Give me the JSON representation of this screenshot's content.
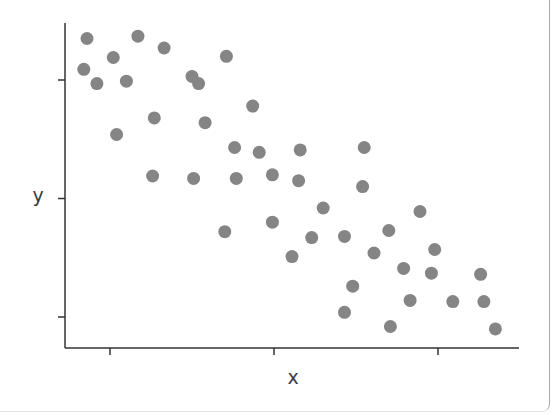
{
  "chart_data": {
    "type": "scatter",
    "title": "",
    "xlabel": "x",
    "ylabel": "y",
    "xticks": [
      1,
      2,
      3
    ],
    "yticks": [
      1,
      2,
      3
    ],
    "xtick_labels": [
      "",
      "",
      ""
    ],
    "ytick_labels": [
      "",
      "",
      ""
    ],
    "xlim": [
      0.66,
      3.49
    ],
    "ylim": [
      0.77,
      3.48
    ],
    "grid": false,
    "legend": null,
    "marker_color": "#858585",
    "marker_radius_px": 6.5,
    "points": [
      {
        "x": 0.86,
        "y": 3.35
      },
      {
        "x": 1.17,
        "y": 3.37
      },
      {
        "x": 1.33,
        "y": 3.27
      },
      {
        "x": 1.02,
        "y": 3.19
      },
      {
        "x": 0.84,
        "y": 3.09
      },
      {
        "x": 0.92,
        "y": 2.97
      },
      {
        "x": 1.1,
        "y": 2.99
      },
      {
        "x": 1.71,
        "y": 3.2
      },
      {
        "x": 1.5,
        "y": 3.03
      },
      {
        "x": 1.54,
        "y": 2.97
      },
      {
        "x": 1.87,
        "y": 2.78
      },
      {
        "x": 1.27,
        "y": 2.68
      },
      {
        "x": 1.58,
        "y": 2.64
      },
      {
        "x": 1.04,
        "y": 2.54
      },
      {
        "x": 1.76,
        "y": 2.43
      },
      {
        "x": 1.26,
        "y": 2.19
      },
      {
        "x": 1.51,
        "y": 2.17
      },
      {
        "x": 1.77,
        "y": 2.17
      },
      {
        "x": 1.91,
        "y": 2.39
      },
      {
        "x": 2.16,
        "y": 2.41
      },
      {
        "x": 2.55,
        "y": 2.43
      },
      {
        "x": 1.99,
        "y": 2.2
      },
      {
        "x": 2.15,
        "y": 2.15
      },
      {
        "x": 2.54,
        "y": 2.1
      },
      {
        "x": 2.3,
        "y": 1.92
      },
      {
        "x": 1.99,
        "y": 1.8
      },
      {
        "x": 1.7,
        "y": 1.72
      },
      {
        "x": 2.23,
        "y": 1.67
      },
      {
        "x": 2.11,
        "y": 1.51
      },
      {
        "x": 2.43,
        "y": 1.68
      },
      {
        "x": 2.89,
        "y": 1.89
      },
      {
        "x": 2.7,
        "y": 1.73
      },
      {
        "x": 2.61,
        "y": 1.54
      },
      {
        "x": 2.98,
        "y": 1.57
      },
      {
        "x": 2.79,
        "y": 1.41
      },
      {
        "x": 2.96,
        "y": 1.37
      },
      {
        "x": 3.26,
        "y": 1.36
      },
      {
        "x": 2.48,
        "y": 1.26
      },
      {
        "x": 2.83,
        "y": 1.14
      },
      {
        "x": 3.09,
        "y": 1.13
      },
      {
        "x": 3.28,
        "y": 1.13
      },
      {
        "x": 2.43,
        "y": 1.04
      },
      {
        "x": 2.71,
        "y": 0.92
      },
      {
        "x": 3.35,
        "y": 0.9
      }
    ]
  }
}
